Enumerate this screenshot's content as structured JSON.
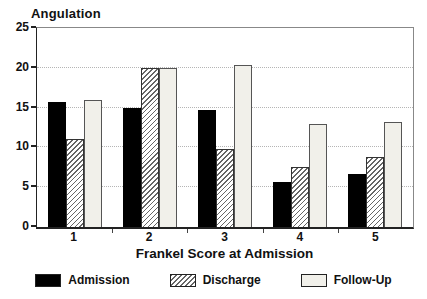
{
  "chart_data": {
    "type": "bar",
    "title": "Angulation",
    "xlabel": "Frankel Score at Admission",
    "ylabel": "Angulation",
    "ylim": [
      0,
      25
    ],
    "y_ticks": [
      0,
      5,
      10,
      15,
      20,
      25
    ],
    "categories": [
      "1",
      "2",
      "3",
      "4",
      "5"
    ],
    "series": [
      {
        "name": "Admission",
        "style": "solid",
        "values": [
          15.7,
          15.0,
          14.7,
          5.7,
          6.7
        ]
      },
      {
        "name": "Discharge",
        "style": "hatch",
        "values": [
          11.1,
          20.0,
          9.8,
          7.5,
          8.8
        ]
      },
      {
        "name": "Follow-Up",
        "style": "light",
        "values": [
          15.9,
          20.0,
          20.3,
          12.9,
          13.2
        ]
      }
    ],
    "legend_position": "bottom",
    "grid": "horizontal-dotted"
  },
  "colors": {
    "background": "#ffffff",
    "text": "#111111",
    "axis": "#222222",
    "frame": "#888888",
    "gridline": "#b5b5b5",
    "bar_solid": "#000000",
    "bar_hatch_bg": "#ffffff",
    "bar_hatch_line": "#666666",
    "bar_light": "#f1f0ea"
  }
}
